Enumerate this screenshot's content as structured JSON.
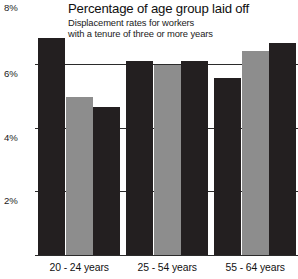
{
  "chart_data": {
    "type": "bar",
    "title": "Percentage of age group laid off",
    "subtitle_line1": "Displacement rates for workers",
    "subtitle_line2": "with a tenure of three or more years",
    "xlabel": "",
    "ylabel": "",
    "ylim": [
      0,
      8
    ],
    "grid": true,
    "legend": "none",
    "ytick_labels": [
      "8%",
      "6%",
      "4%",
      "2%"
    ],
    "ytick_values": [
      8,
      6,
      4,
      2
    ],
    "categories": [
      "20 - 24 years",
      "25 - 54 years",
      "55 - 64 years"
    ],
    "series": [
      {
        "name": "series-1",
        "color": "#231f20",
        "values": [
          6.8,
          6.1,
          5.55
        ]
      },
      {
        "name": "series-2",
        "color": "#8d8d8d",
        "values": [
          4.95,
          5.95,
          6.4
        ]
      },
      {
        "name": "series-3",
        "color": "#231f20",
        "values": [
          4.65,
          6.1,
          6.65
        ]
      }
    ],
    "bars": [
      {
        "group": "20 - 24 years",
        "index": 0,
        "value": 6.8,
        "color": "#231f20"
      },
      {
        "group": "20 - 24 years",
        "index": 1,
        "value": 4.95,
        "color": "#8d8d8d"
      },
      {
        "group": "20 - 24 years",
        "index": 2,
        "value": 4.65,
        "color": "#231f20"
      },
      {
        "group": "25 - 54 years",
        "index": 0,
        "value": 6.1,
        "color": "#231f20"
      },
      {
        "group": "25 - 54 years",
        "index": 1,
        "value": 5.95,
        "color": "#8d8d8d"
      },
      {
        "group": "25 - 54 years",
        "index": 2,
        "value": 6.1,
        "color": "#231f20"
      },
      {
        "group": "55 - 64 years",
        "index": 0,
        "value": 5.55,
        "color": "#231f20"
      },
      {
        "group": "55 - 64 years",
        "index": 1,
        "value": 6.4,
        "color": "#8d8d8d"
      },
      {
        "group": "55 - 64 years",
        "index": 2,
        "value": 6.65,
        "color": "#231f20"
      }
    ],
    "colors": {
      "dark_bar": "#231f20",
      "light_bar": "#8d8d8d",
      "gridline": "#2b2b2b",
      "background": "#ffffff",
      "text": "#1a1a1a"
    }
  }
}
